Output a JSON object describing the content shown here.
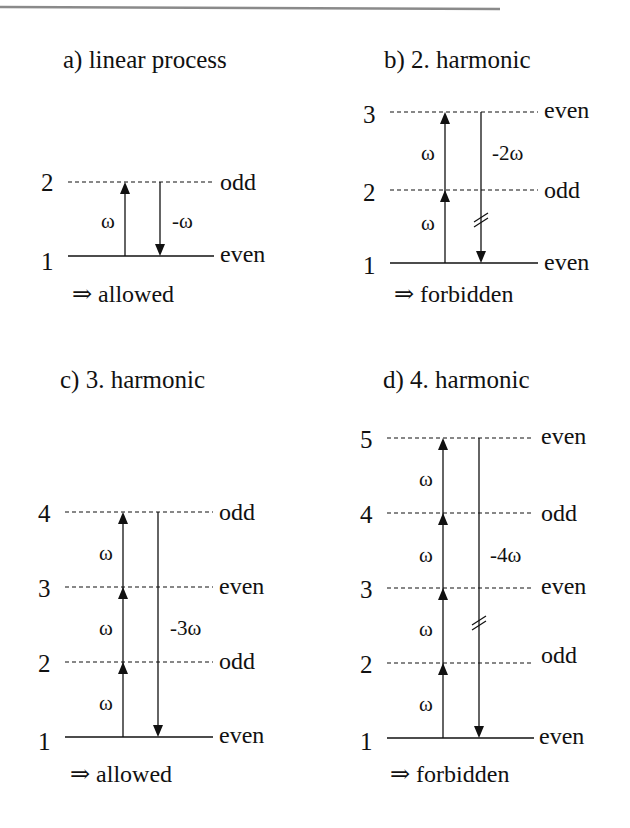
{
  "panels": [
    {
      "id": "a",
      "title": "a) linear process",
      "levels": [
        {
          "n": "1",
          "parity": "even",
          "style": "solid"
        },
        {
          "n": "2",
          "parity": "odd",
          "style": "dashed"
        }
      ],
      "up_steps": [
        "ω"
      ],
      "down_label": "-ω",
      "down_forbidden_mark": false,
      "result": "⇒ allowed"
    },
    {
      "id": "b",
      "title": "b) 2. harmonic",
      "levels": [
        {
          "n": "1",
          "parity": "even",
          "style": "solid"
        },
        {
          "n": "2",
          "parity": "odd",
          "style": "dashed"
        },
        {
          "n": "3",
          "parity": "even",
          "style": "dashed"
        }
      ],
      "up_steps": [
        "ω",
        "ω"
      ],
      "down_label": "-2ω",
      "down_forbidden_mark": true,
      "result": "⇒ forbidden"
    },
    {
      "id": "c",
      "title": "c) 3. harmonic",
      "levels": [
        {
          "n": "1",
          "parity": "even",
          "style": "solid"
        },
        {
          "n": "2",
          "parity": "odd",
          "style": "dashed"
        },
        {
          "n": "3",
          "parity": "even",
          "style": "dashed"
        },
        {
          "n": "4",
          "parity": "odd",
          "style": "dashed"
        }
      ],
      "up_steps": [
        "ω",
        "ω",
        "ω"
      ],
      "down_label": "-3ω",
      "down_forbidden_mark": false,
      "result": "⇒ allowed"
    },
    {
      "id": "d",
      "title": "d) 4. harmonic",
      "levels": [
        {
          "n": "1",
          "parity": "even",
          "style": "solid"
        },
        {
          "n": "2",
          "parity": "odd",
          "style": "dashed"
        },
        {
          "n": "3",
          "parity": "even",
          "style": "dashed"
        },
        {
          "n": "4",
          "parity": "odd",
          "style": "dashed"
        },
        {
          "n": "5",
          "parity": "even",
          "style": "dashed"
        }
      ],
      "up_steps": [
        "ω",
        "ω",
        "ω",
        "ω"
      ],
      "down_label": "-4ω",
      "down_forbidden_mark": true,
      "result": "⇒ forbidden"
    }
  ],
  "colors": {
    "ink": "#111111",
    "rule": "#8a8a8a",
    "background": "#ffffff"
  }
}
